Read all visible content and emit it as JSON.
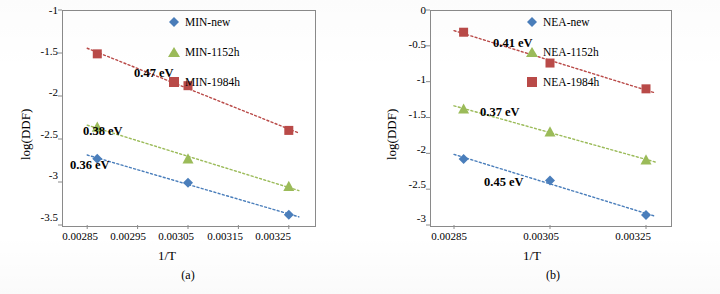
{
  "figure": {
    "panel_a_caption": "(a)",
    "panel_b_caption": "(b)"
  },
  "chart_data": [
    {
      "type": "scatter",
      "panel": "(a)",
      "title": "",
      "xlabel": "1/T",
      "ylabel": "log(DDF)",
      "xlim": [
        0.0028,
        0.0033
      ],
      "ylim": [
        -3.5,
        -1.0
      ],
      "xticks": [
        "0.00285",
        "0.00295",
        "0.00305",
        "0.00315",
        "0.00325"
      ],
      "xtick_values": [
        0.00285,
        0.00295,
        0.00305,
        0.00315,
        0.00325
      ],
      "yticks": [
        "-1",
        "-1.5",
        "-2",
        "-2.5",
        "-3",
        "-3.5"
      ],
      "ytick_values": [
        -1,
        -1.5,
        -2,
        -2.5,
        -3,
        -3.5
      ],
      "grid": false,
      "legend_position": "top-right inside",
      "series": [
        {
          "name": "MIN-new",
          "marker": "diamond",
          "color": "#4a7ebb",
          "line_style": "dotted",
          "x": [
            0.00287,
            0.00305,
            0.00325
          ],
          "y": [
            -2.73,
            -3.01,
            -3.38
          ],
          "annotation": "0.36 eV"
        },
        {
          "name": "MIN-1152h",
          "marker": "triangle",
          "color": "#9bbb59",
          "line_style": "dotted",
          "x": [
            0.00287,
            0.00305,
            0.00325
          ],
          "y": [
            -2.36,
            -2.73,
            -3.05
          ],
          "annotation": "0.38 eV"
        },
        {
          "name": "MIN-1984h",
          "marker": "square",
          "color": "#b94a48",
          "line_style": "dotted",
          "x": [
            0.00287,
            0.00305,
            0.00325
          ],
          "y": [
            -1.51,
            -1.88,
            -2.4
          ],
          "annotation": "0.47 eV"
        }
      ],
      "annotations": [
        "0.47 eV",
        "0.38 eV",
        "0.36 eV"
      ]
    },
    {
      "type": "scatter",
      "panel": "(b)",
      "title": "",
      "xlabel": "1/T",
      "ylabel": "log(DDF)",
      "xlim": [
        0.0028,
        0.0033
      ],
      "ylim": [
        -3.0,
        0.0
      ],
      "xticks": [
        "0.00285",
        "0.00305",
        "0.00325"
      ],
      "xtick_values": [
        0.00285,
        0.00305,
        0.00325
      ],
      "yticks": [
        "0",
        "-0.5",
        "-1",
        "-1.5",
        "-2",
        "-2.5",
        "-3"
      ],
      "ytick_values": [
        0,
        -0.5,
        -1,
        -1.5,
        -2,
        -2.5,
        -3
      ],
      "grid": false,
      "legend_position": "top-right inside",
      "series": [
        {
          "name": "NEA-new",
          "marker": "diamond",
          "color": "#4a7ebb",
          "line_style": "dotted",
          "x": [
            0.00287,
            0.00305,
            0.00325
          ],
          "y": [
            -2.08,
            -2.38,
            -2.86
          ],
          "annotation": "0.45 eV"
        },
        {
          "name": "NEA-1152h",
          "marker": "triangle",
          "color": "#9bbb59",
          "line_style": "dotted",
          "x": [
            0.00287,
            0.00305,
            0.00325
          ],
          "y": [
            -1.38,
            -1.7,
            -2.09
          ],
          "annotation": "0.37 eV"
        },
        {
          "name": "NEA-1984h",
          "marker": "square",
          "color": "#b94a48",
          "line_style": "dotted",
          "x": [
            0.00287,
            0.00305,
            0.00325
          ],
          "y": [
            -0.31,
            -0.74,
            -1.1
          ],
          "annotation": "0.41 eV"
        }
      ],
      "annotations": [
        "0.41 eV",
        "0.37 eV",
        "0.45 eV"
      ]
    }
  ]
}
